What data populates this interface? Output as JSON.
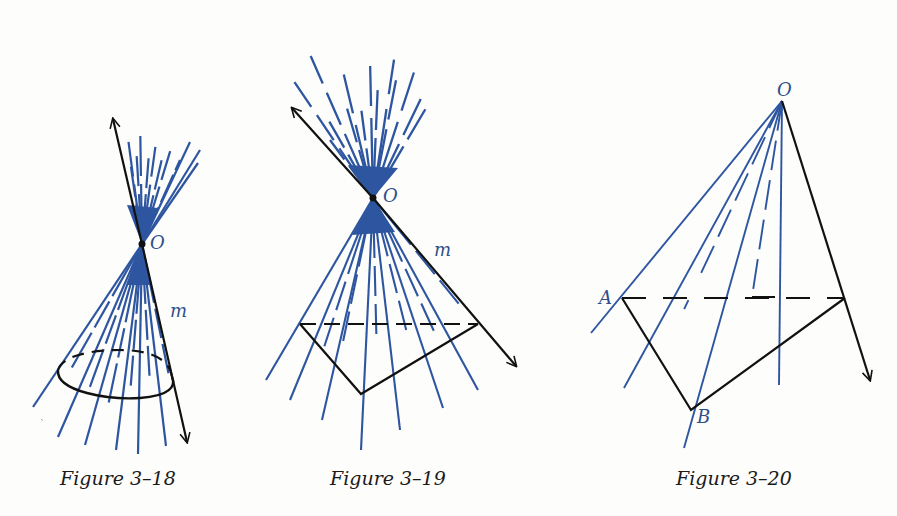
{
  "colors": {
    "ray_blue": "#2e56a0",
    "line_black": "#111111",
    "background": "#fdfdfb"
  },
  "figures": [
    {
      "id": "3-18",
      "caption": "Figure 3–18",
      "labels": {
        "vertex": "O",
        "line": "m"
      },
      "description": "Double cone with vertex O, axis line m, circular base"
    },
    {
      "id": "3-19",
      "caption": "Figure 3–19",
      "labels": {
        "vertex": "O",
        "line": "m"
      },
      "description": "Double pyramid-like surface with vertex O, line m, triangular base"
    },
    {
      "id": "3-20",
      "caption": "Figure 3–20",
      "labels": {
        "vertex": "O",
        "point_a": "A",
        "point_b": "B"
      },
      "description": "Rays from O through triangle with vertices A and B"
    }
  ]
}
